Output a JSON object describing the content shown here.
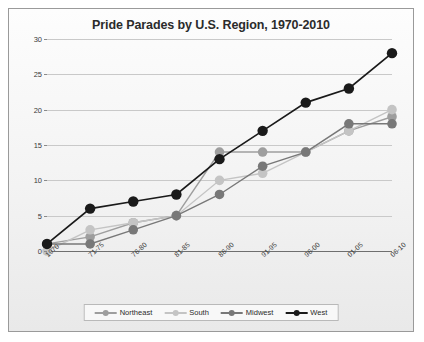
{
  "chart_data": {
    "type": "line",
    "title": "Pride Parades by U.S. Region, 1970-2010",
    "xlabel": "",
    "ylabel": "",
    "ylim": [
      0,
      30
    ],
    "yticks": [
      0,
      5,
      10,
      15,
      20,
      25,
      30
    ],
    "grid": true,
    "legend_position": "bottom",
    "categories": [
      "1970",
      "71-75",
      "76-80",
      "81-85",
      "86-90",
      "91-95",
      "96-00",
      "01-05",
      "06-10"
    ],
    "series": [
      {
        "name": "Northeast",
        "color": "#9e9e9e",
        "values": [
          1,
          2,
          4,
          5,
          14,
          14,
          14,
          17,
          19
        ]
      },
      {
        "name": "South",
        "color": "#c4c4c4",
        "values": [
          0,
          3,
          4,
          5,
          10,
          11,
          14,
          17,
          20
        ]
      },
      {
        "name": "Midwest",
        "color": "#787878",
        "values": [
          1,
          1,
          3,
          5,
          8,
          12,
          14,
          18,
          18
        ]
      },
      {
        "name": "West",
        "color": "#1a1a1a",
        "values": [
          1,
          6,
          7,
          8,
          13,
          17,
          21,
          23,
          28
        ]
      }
    ]
  },
  "legend": {
    "items": [
      {
        "label": "Northeast"
      },
      {
        "label": "South"
      },
      {
        "label": "Midwest"
      },
      {
        "label": "West"
      }
    ]
  }
}
